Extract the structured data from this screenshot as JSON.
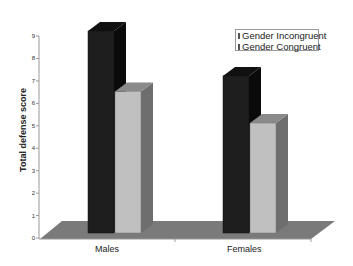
{
  "chart_data": {
    "type": "bar",
    "style": "3d-clustered-column",
    "title": "",
    "xlabel": "",
    "ylabel": "Total defense score",
    "categories": [
      "Males",
      "Females"
    ],
    "series": [
      {
        "name": "Gender Incongruent",
        "values": [
          9.0,
          7.0
        ],
        "color": "#1e1e1e"
      },
      {
        "name": "Gender Congruent",
        "values": [
          6.3,
          4.9
        ],
        "color": "#c0c0c0"
      }
    ],
    "ylim": [
      0,
      9
    ],
    "yticks": [
      "0",
      "1",
      "2",
      "3",
      "4",
      "5",
      "6",
      "7",
      "8",
      "9"
    ],
    "grid": false,
    "legend_position": "top-right",
    "floor_color": "#7a7a7a"
  },
  "legend": {
    "items": [
      {
        "label": "Gender Incongruent",
        "color": "#1e1e1e"
      },
      {
        "label": "Gender Congruent",
        "color": "#c0c0c0"
      }
    ]
  },
  "axis": {
    "ylabel": "Total defense score",
    "categories": [
      "Males",
      "Females"
    ]
  }
}
